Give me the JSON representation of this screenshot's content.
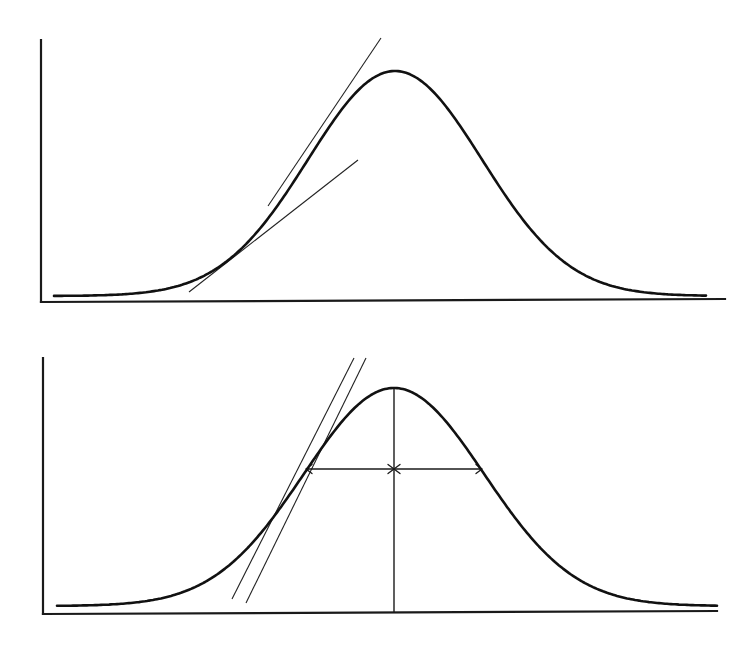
{
  "figure": {
    "colors": {
      "ink": "#111111",
      "background": "#ffffff"
    }
  },
  "panels": [
    {
      "id": "top",
      "axes": {
        "y_axis": {
          "x": 41,
          "y_top": 40,
          "y_bottom": 302
        },
        "x_axis": {
          "x_start": 41,
          "y_start": 302,
          "x_end": 725,
          "y_end": 299
        }
      },
      "peak": {
        "center_x": 395,
        "peak_y": 71,
        "baseline_y": 296,
        "sigma": 87,
        "x_start": 54,
        "x_end": 707
      },
      "tangents": [
        {
          "name": "steep-tangent-line",
          "x1": 268,
          "y1": 206,
          "x2": 381,
          "y2": 38
        },
        {
          "name": "shallow-tangent-line",
          "x1": 189,
          "y1": 292,
          "x2": 358,
          "y2": 160
        }
      ]
    },
    {
      "id": "bottom",
      "axes": {
        "y_axis": {
          "x": 43,
          "y_top": 358,
          "y_bottom": 614
        },
        "x_axis": {
          "x_start": 43,
          "y_start": 614,
          "x_end": 717,
          "y_end": 611
        }
      },
      "peak": {
        "center_x": 394,
        "peak_y": 388,
        "baseline_y": 606,
        "sigma": 90,
        "x_start": 57,
        "x_end": 717
      },
      "tangents": [
        {
          "name": "tangent-line-a",
          "x1": 232,
          "y1": 599,
          "x2": 354,
          "y2": 358
        },
        {
          "name": "tangent-line-b",
          "x1": 246,
          "y1": 603,
          "x2": 366,
          "y2": 358
        }
      ],
      "peak_marker": {
        "x": 394,
        "y_top": 388,
        "y_bottom": 613
      },
      "width_arrows": {
        "y": 469,
        "x_left": 306,
        "x_center": 394,
        "x_right": 482
      }
    }
  ]
}
